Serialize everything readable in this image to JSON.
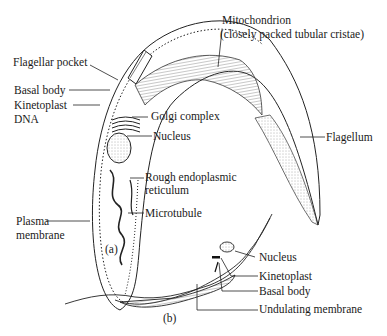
{
  "figure": {
    "panel_a": {
      "caption": "(a)",
      "labels": {
        "flagellar_pocket": "Flagellar pocket",
        "basal_body": "Basal body",
        "kinetoplast_line1": "Kinetoplast",
        "kinetoplast_line2": "DNA",
        "golgi": "Golgi complex",
        "nucleus": "Nucleus",
        "rer_line1": "Rough endoplasmic",
        "rer_line2": "reticulum",
        "microtubule": "Microtubule",
        "plasma_line1": "Plasma",
        "plasma_line2": "membrane",
        "mito_line1": "Mitochondrion",
        "mito_line2": "(closely packed tubular cristae)",
        "flagellum": "Flagellum"
      }
    },
    "panel_b": {
      "caption": "(b)",
      "labels": {
        "nucleus": "Nucleus",
        "kinetoplast": "Kinetoplast",
        "basal_body": "Basal body",
        "undulating_membrane": "Undulating membrane"
      }
    }
  }
}
